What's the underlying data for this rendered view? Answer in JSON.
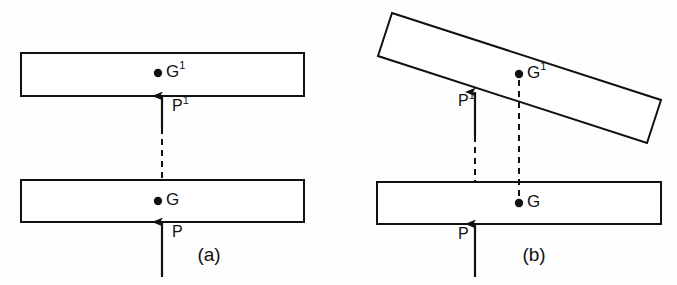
{
  "figure": {
    "background_color": "#fefefe",
    "ink_color": "#111111",
    "width": 677,
    "height": 285
  },
  "panels": [
    {
      "id": "a",
      "caption": "(a)",
      "caption_x": 209,
      "caption_y": 256,
      "description": "Undeformed: upper plate horizontal, force P aligned with centroid G",
      "plates": [
        {
          "name": "upper-plate",
          "points": "21,53 304,53 304,96 21,96"
        },
        {
          "name": "lower-plate",
          "points": "21,180 304,180 304,222 21,222"
        }
      ],
      "points": [
        {
          "label": "G",
          "superscript": "1",
          "dot_x": 158,
          "dot_y": 73,
          "text_x": 166,
          "text_y": 73
        },
        {
          "label": "G",
          "superscript": "",
          "dot_x": 158,
          "dot_y": 201,
          "text_x": 166,
          "text_y": 201
        }
      ],
      "forces": [
        {
          "label": "P",
          "superscript": "1",
          "name": "force-p-prime",
          "shaft_x": 162,
          "shaft_y1": 128,
          "shaft_y2": 98,
          "tip_x": 162,
          "tip_y": 96,
          "text_x": 172,
          "text_y": 107
        },
        {
          "label": "P",
          "superscript": "",
          "name": "force-p",
          "shaft_x": 162,
          "shaft_y1": 277,
          "shaft_y2": 224,
          "tip_x": 162,
          "tip_y": 222,
          "text_x": 172,
          "text_y": 233
        }
      ],
      "dashed": [
        {
          "name": "centroid-alignment-line",
          "x1": 162,
          "y1": 128,
          "x2": 162,
          "y2": 180
        }
      ]
    },
    {
      "id": "b",
      "caption": "(b)",
      "caption_x": 534,
      "caption_y": 256,
      "description": "Rotated: upper plate tilted, force P offset from centroid G causing rotation",
      "plates": [
        {
          "name": "upper-plate-tilted",
          "points": "392,13 661,100 647,143 378,56"
        },
        {
          "name": "lower-plate",
          "points": "377,182 661,182 661,224 377,224"
        }
      ],
      "points": [
        {
          "label": "G",
          "superscript": "1",
          "dot_x": 519,
          "dot_y": 74,
          "text_x": 527,
          "text_y": 74
        },
        {
          "label": "G",
          "superscript": "",
          "dot_x": 519,
          "dot_y": 203,
          "text_x": 527,
          "text_y": 203
        }
      ],
      "forces": [
        {
          "label": "P",
          "superscript": "1",
          "name": "force-p-prime",
          "shaft_x": 475,
          "shaft_y1": 136,
          "shaft_y2": 95,
          "tip_x": 475,
          "tip_y": 92,
          "text_x": 458,
          "text_y": 102
        },
        {
          "label": "P",
          "superscript": "",
          "name": "force-p",
          "shaft_x": 475,
          "shaft_y1": 277,
          "shaft_y2": 226,
          "tip_x": 475,
          "tip_y": 224,
          "text_x": 458,
          "text_y": 235
        }
      ],
      "dashed": [
        {
          "name": "force-projection-line",
          "x1": 475,
          "y1": 136,
          "x2": 475,
          "y2": 182
        },
        {
          "name": "centroid-offset-line",
          "x1": 519,
          "y1": 80,
          "x2": 519,
          "y2": 199
        }
      ]
    }
  ]
}
